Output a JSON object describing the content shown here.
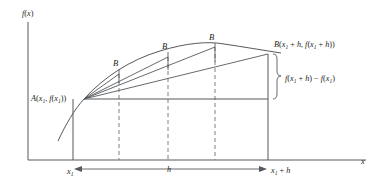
{
  "figure": {
    "title": "",
    "axes": {
      "y_label": "f(x)",
      "x_label": "x",
      "origin": {
        "x": 28,
        "y": 160
      },
      "y_top": 22,
      "x_right": 366
    },
    "points": {
      "A": {
        "label_parts": {
          "name": "A",
          "open": "(",
          "x_sym": "x",
          "x_sub": "1",
          "comma": ", ",
          "f": "f",
          "fopen": "(",
          "fx_sym": "x",
          "fx_sub": "1",
          "close": "))"
        },
        "label_text": "A(x1, f(x1))",
        "px": 84,
        "py": 99
      },
      "B_final": {
        "label_text": "B(x1 + h, f(x1 + h))",
        "px": 268,
        "py": 54
      },
      "B_intermediate": [
        {
          "label": "B",
          "px": 119,
          "py": 75
        },
        {
          "label": "B",
          "px": 168,
          "py": 58
        },
        {
          "label": "B",
          "px": 215,
          "py": 49
        }
      ]
    },
    "annotations": {
      "delta_label": "f(x1 + h) - f(x1)",
      "delta_brace_top": 54,
      "delta_brace_bottom": 99,
      "h_label": "h",
      "x1_label": "x1",
      "x1h_label": "x1 + h"
    },
    "dashed_verticals": [
      119,
      168,
      215
    ],
    "colors": {
      "line": "#55595c",
      "curve": "#55595c",
      "dashed": "#7a7f83",
      "text": "#231f20",
      "background": "#ffffff"
    },
    "curve": {
      "description": "concave-down function rising from lower-left through A, peaking near x=222, descending slightly to B",
      "start": {
        "x": 58,
        "y": 140
      },
      "peak": {
        "x": 222,
        "y": 44
      },
      "end": {
        "x": 281,
        "y": 52
      }
    },
    "baseline_y": 99,
    "axis_y": 160
  }
}
